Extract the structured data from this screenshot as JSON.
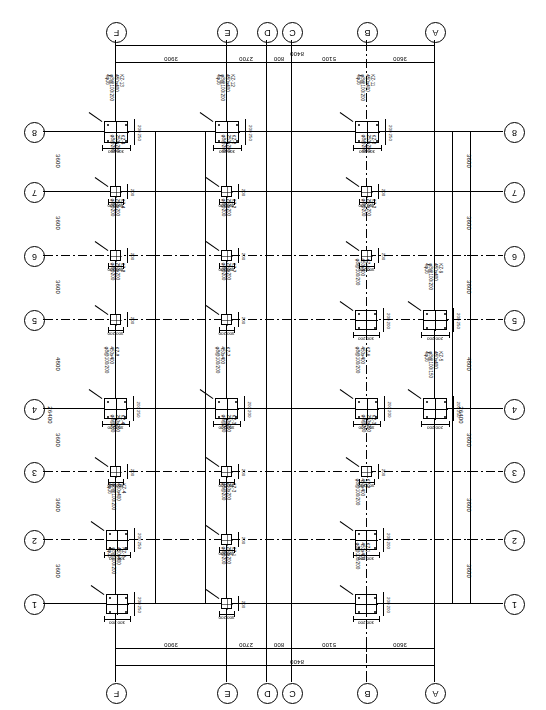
{
  "drawing": {
    "type": "structural-column-layout-plan",
    "orientation_note": "plan rendered rotated 180 degrees; all annotation text appears inverted",
    "overall_width_mm": 8400,
    "overall_height_mm": 26400
  },
  "horizontal_axis": {
    "label_order_left_to_right": [
      "F",
      "E",
      "D",
      "C",
      "B",
      "A"
    ],
    "bubbles": [
      {
        "id": "F",
        "label": "F",
        "x_mm": 0
      },
      {
        "id": "E",
        "label": "E",
        "x_mm": 3900
      },
      {
        "id": "D",
        "label": "D",
        "x_mm": 6600
      },
      {
        "id": "C",
        "label": "C",
        "x_mm": 7400
      },
      {
        "id": "B",
        "label": "B",
        "x_mm": 12500
      },
      {
        "id": "A",
        "label": "A",
        "x_mm": 16100
      }
    ],
    "bay_dimensions": [
      "3900",
      "2700",
      "800",
      "5100",
      "3600"
    ],
    "overall_dimension": "8400"
  },
  "vertical_axis": {
    "label_order_top_to_bottom": [
      "8",
      "7",
      "6",
      "5",
      "4",
      "3",
      "2",
      "1"
    ],
    "bubbles": [
      {
        "id": "8",
        "label": "8"
      },
      {
        "id": "7",
        "label": "7"
      },
      {
        "id": "6",
        "label": "6"
      },
      {
        "id": "5",
        "label": "5"
      },
      {
        "id": "4",
        "label": "4"
      },
      {
        "id": "3",
        "label": "3"
      },
      {
        "id": "2",
        "label": "2"
      },
      {
        "id": "1",
        "label": "1"
      }
    ],
    "bay_dimensions": [
      "3600",
      "3600",
      "3600",
      "4800",
      "3600",
      "3600",
      "3600"
    ],
    "overall_dimension": "26400",
    "sub_dimension": "4800"
  },
  "column_schedule": {
    "note_format": "tag / section / stirrup",
    "entries": [
      {
        "tag": "KZ-1",
        "section": "450x400",
        "stirrup": "φ8@100/200"
      },
      {
        "tag": "KZ-2",
        "section": "450x400",
        "stirrup": "φ8@100/200"
      },
      {
        "tag": "KZ-3",
        "section": "250x200",
        "stirrup": "φ8@200"
      },
      {
        "tag": "KZ-4",
        "section": "250x200",
        "stirrup": "φ8@200"
      },
      {
        "tag": "KZ-5",
        "section": "450x400",
        "stirrup": "φ8@100/150"
      },
      {
        "tag": "KZ-6",
        "section": "450x400",
        "stirrup": "φ8@100/200"
      },
      {
        "tag": "KZ-7",
        "section": "450x400",
        "stirrup": "φ8@100/200"
      },
      {
        "tag": "KZ-8",
        "section": "450x400",
        "stirrup": "φ8@100/200"
      },
      {
        "tag": "KZ-9",
        "section": "450x400",
        "stirrup": "φ8@100/200"
      },
      {
        "tag": "KZ-10",
        "section": "450x400",
        "stirrup": "φ8@100/200"
      },
      {
        "tag": "KZ-11",
        "section": "450x400",
        "stirrup": "φ8@100/200"
      },
      {
        "tag": "KZ-12",
        "section": "450x400",
        "stirrup": "φ8@100/200"
      },
      {
        "tag": "KZ-13",
        "section": "450x400",
        "stirrup": "φ8@100/200"
      }
    ]
  },
  "columns": [
    {
      "id": "c-8-F",
      "tag": "KZ-13",
      "grid_v": "8",
      "grid_h": "F",
      "size": "large",
      "x": 104,
      "y": 121,
      "w": 24,
      "h": 22,
      "section": "450x400",
      "stirrup": "φ8@100/200",
      "dim_bottom": "300 200",
      "dim_right": "200 250",
      "rebar": "4φ16"
    },
    {
      "id": "c-8-E",
      "tag": "KZ-12",
      "grid_v": "8",
      "grid_h": "E",
      "size": "large",
      "x": 215,
      "y": 121,
      "w": 24,
      "h": 22,
      "section": "450x400",
      "stirrup": "φ8@100/200",
      "dim_bottom": "300 200",
      "dim_right": "200 250",
      "rebar": "4φ16"
    },
    {
      "id": "c-8-B",
      "tag": "KZ-11",
      "grid_v": "8",
      "grid_h": "B",
      "size": "large",
      "x": 355,
      "y": 121,
      "w": 24,
      "h": 22,
      "section": "450x400",
      "stirrup": "φ8@100/200",
      "dim_bottom": "300 200",
      "dim_right": "200 250",
      "rebar": "4φ16"
    },
    {
      "id": "c-7-F",
      "tag": "KZ-4",
      "grid_v": "7",
      "grid_h": "F",
      "size": "small",
      "x": 110,
      "y": 186,
      "w": 11,
      "h": 11,
      "section": "250x200",
      "stirrup": "φ8@200",
      "dim_bottom": "300 200",
      "dim_right": "200"
    },
    {
      "id": "c-7-E",
      "tag": "KZ-2",
      "grid_v": "7",
      "grid_h": "E",
      "size": "small",
      "x": 221,
      "y": 186,
      "w": 11,
      "h": 11,
      "section": "250x200",
      "stirrup": "φ8@200",
      "dim_bottom": "300 200",
      "dim_right": "200"
    },
    {
      "id": "c-7-B",
      "tag": "KZ-3",
      "grid_v": "7",
      "grid_h": "B",
      "size": "small",
      "x": 361,
      "y": 186,
      "w": 11,
      "h": 11,
      "section": "250x200",
      "stirrup": "φ8@200",
      "dim_bottom": "300 200",
      "dim_right": "200"
    },
    {
      "id": "c-6-F",
      "tag": "KZ-4",
      "grid_v": "6",
      "grid_h": "F",
      "size": "small",
      "x": 110,
      "y": 250,
      "w": 11,
      "h": 11,
      "section": "250x200",
      "stirrup": "φ8@200",
      "dim_bottom": "300 200",
      "dim_right": "200"
    },
    {
      "id": "c-6-E",
      "tag": "KZ-2",
      "grid_v": "6",
      "grid_h": "E",
      "size": "small",
      "x": 221,
      "y": 250,
      "w": 11,
      "h": 11,
      "section": "250x200",
      "stirrup": "φ8@200",
      "dim_bottom": "300 200",
      "dim_right": "200"
    },
    {
      "id": "c-6-B",
      "tag": "KZ-3",
      "grid_v": "6",
      "grid_h": "B",
      "size": "small",
      "x": 361,
      "y": 250,
      "w": 11,
      "h": 11,
      "section": "250x200",
      "stirrup": "φ8@200",
      "dim_bottom": "300 200",
      "dim_right": "200"
    },
    {
      "id": "c-5-F",
      "tag": "KZ-8",
      "grid_v": "5",
      "grid_h": "F",
      "size": "small",
      "x": 110,
      "y": 314,
      "w": 11,
      "h": 11,
      "section": "250x200",
      "stirrup": "φ8@200",
      "dim_bottom": "300 200",
      "dim_right": "200"
    },
    {
      "id": "c-5-E",
      "tag": "KZ-7",
      "grid_v": "5",
      "grid_h": "E",
      "size": "small",
      "x": 221,
      "y": 314,
      "w": 11,
      "h": 11,
      "section": "250x200",
      "stirrup": "φ8@200",
      "dim_bottom": "300 200",
      "dim_right": "200"
    },
    {
      "id": "c-5-B",
      "tag": "KZ-10",
      "grid_v": "5",
      "grid_h": "B",
      "size": "large",
      "x": 355,
      "y": 310,
      "w": 22,
      "h": 20,
      "section": "450x400",
      "stirrup": "φ8@100/200",
      "dim_bottom": "300 200",
      "dim_right": "200 200"
    },
    {
      "id": "c-5-A",
      "tag": "KZ-9",
      "grid_v": "5",
      "grid_h": "A",
      "size": "large",
      "x": 423,
      "y": 310,
      "w": 24,
      "h": 20,
      "section": "450x400",
      "stirrup": "φ8@100/200",
      "dim_bottom": "200 200",
      "dim_right": "200 250",
      "rebar": "4φ16"
    },
    {
      "id": "c-4-F",
      "tag": "KZ-8",
      "grid_v": "4",
      "grid_h": "F",
      "size": "large",
      "x": 104,
      "y": 398,
      "w": 23,
      "h": 21,
      "section": "450x400",
      "stirrup": "φ8@100/200",
      "dim_bottom": "300 200",
      "dim_right": "200 250"
    },
    {
      "id": "c-4-E",
      "tag": "KZ-7",
      "grid_v": "4",
      "grid_h": "E",
      "size": "large",
      "x": 215,
      "y": 398,
      "w": 23,
      "h": 21,
      "section": "450x400",
      "stirrup": "φ8@100/200",
      "dim_bottom": "300 200",
      "dim_right": "200 200"
    },
    {
      "id": "c-4-B",
      "tag": "KZ-6",
      "grid_v": "4",
      "grid_h": "B",
      "size": "large",
      "x": 355,
      "y": 398,
      "w": 23,
      "h": 21,
      "section": "450x400",
      "stirrup": "φ8@100/200",
      "dim_bottom": "300 200",
      "dim_right": "200 200"
    },
    {
      "id": "c-4-A",
      "tag": "KZ-5",
      "grid_v": "4",
      "grid_h": "A",
      "size": "large",
      "x": 423,
      "y": 398,
      "w": 24,
      "h": 21,
      "section": "450x400",
      "stirrup": "φ8@100/150",
      "dim_bottom": "200 200",
      "dim_right": "200 250",
      "rebar": "4φ16"
    },
    {
      "id": "c-3-F",
      "tag": "KZ-4",
      "grid_v": "3",
      "grid_h": "F",
      "size": "small",
      "x": 110,
      "y": 466,
      "w": 11,
      "h": 11,
      "section": "250x200",
      "stirrup": "φ8@200",
      "dim_bottom": "300 200",
      "dim_right": "200"
    },
    {
      "id": "c-3-E",
      "tag": "KZ-3",
      "grid_v": "3",
      "grid_h": "E",
      "size": "small",
      "x": 221,
      "y": 466,
      "w": 11,
      "h": 11,
      "section": "250x200",
      "stirrup": "φ8@200",
      "dim_bottom": "300 200",
      "dim_right": "200"
    },
    {
      "id": "c-3-B",
      "tag": "KZ-3",
      "grid_v": "3",
      "grid_h": "B",
      "size": "small",
      "x": 361,
      "y": 466,
      "w": 11,
      "h": 11,
      "section": "250x200",
      "stirrup": "φ8@200",
      "dim_bottom": "300 200",
      "dim_right": "200"
    },
    {
      "id": "c-2-F",
      "tag": "KZ-4",
      "grid_v": "2",
      "grid_h": "F",
      "size": "large",
      "x": 106,
      "y": 530,
      "w": 22,
      "h": 20,
      "section": "450x400",
      "stirrup": "φ8@100/200",
      "dim_bottom": "300 200",
      "dim_right": "200 250",
      "rebar": "4φ16"
    },
    {
      "id": "c-2-E",
      "tag": "KZ-3",
      "grid_v": "2",
      "grid_h": "E",
      "size": "small",
      "x": 221,
      "y": 534,
      "w": 11,
      "h": 11,
      "section": "250x200",
      "stirrup": "φ8@200",
      "dim_bottom": "300 200",
      "dim_right": "200"
    },
    {
      "id": "c-2-B",
      "tag": "KZ-2",
      "grid_v": "2",
      "grid_h": "B",
      "size": "large",
      "x": 355,
      "y": 530,
      "w": 22,
      "h": 20,
      "section": "450x400",
      "stirrup": "φ8@100/200",
      "dim_bottom": "300 200",
      "dim_right": "200 200"
    },
    {
      "id": "c-1-F",
      "tag": "KZ-2",
      "grid_v": "1",
      "grid_h": "F",
      "size": "large",
      "x": 106,
      "y": 594,
      "w": 22,
      "h": 20,
      "section": "450x400",
      "stirrup": "φ8@100/200",
      "dim_bottom": "300 200",
      "dim_right": "200 250",
      "rebar": "4φ16"
    },
    {
      "id": "c-1-E",
      "tag": "KZ-1",
      "grid_v": "1",
      "grid_h": "E",
      "size": "small",
      "x": 221,
      "y": 598,
      "w": 11,
      "h": 11,
      "section": "250x200",
      "stirrup": "φ8@200",
      "dim_bottom": "300 200",
      "dim_right": "200"
    },
    {
      "id": "c-1-B",
      "tag": "KZ-1",
      "grid_v": "1",
      "grid_h": "B",
      "size": "large",
      "x": 355,
      "y": 594,
      "w": 22,
      "h": 20,
      "section": "450x400",
      "stirrup": "φ8@100/200",
      "dim_bottom": "300 200",
      "dim_right": "200 200"
    }
  ]
}
